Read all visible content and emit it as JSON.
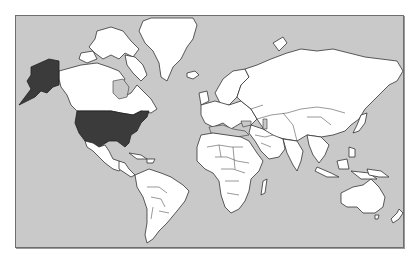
{
  "map": {
    "projection": "mercator",
    "type": "world-political-outline",
    "colors": {
      "ocean": "#c9c9c9",
      "land": "#ffffff",
      "highlight": "#3b3b3b",
      "outline": "#333333",
      "background": "#ffffff"
    },
    "highlighted_regions": [
      "United States (contiguous)",
      "Alaska"
    ],
    "legend": null,
    "labels": []
  }
}
